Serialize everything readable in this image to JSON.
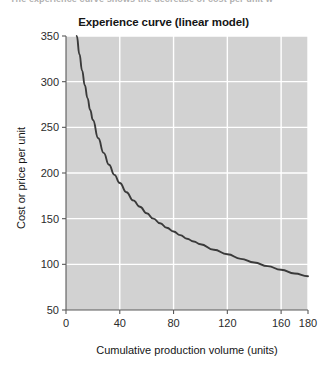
{
  "caption": {
    "text": "The experience curve shows the decrease of cost per unit w"
  },
  "figure": {
    "title": "Experience curve (linear model)",
    "xlabel": "Cumulative production volume (units)",
    "ylabel": "Cost or price per unit"
  },
  "colors": {
    "plot_background": "#d2d2d2",
    "gridline": "#ffffff",
    "curve": "#3a3a3a",
    "axis": "#5a5a5a",
    "title_text": "#151515",
    "tick_text": "#2b2b2b",
    "page_background": "#ffffff"
  },
  "chart_data": {
    "type": "line",
    "title": "Experience curve (linear model)",
    "xlabel": "Cumulative production volume (units)",
    "ylabel": "Cost or price per unit",
    "xlim": [
      0,
      180
    ],
    "ylim": [
      50,
      350
    ],
    "xticks": [
      0,
      40,
      80,
      120,
      160,
      180
    ],
    "yticks": [
      50,
      100,
      150,
      200,
      250,
      300,
      350
    ],
    "xtick_labels": [
      "0",
      "40",
      "80",
      "120",
      "160",
      "180"
    ],
    "ytick_labels": [
      "50",
      "100",
      "150",
      "200",
      "250",
      "300",
      "350"
    ],
    "grid": true,
    "legend": "none",
    "series": [
      {
        "name": "Experience curve",
        "x": [
          8,
          10,
          12,
          14,
          16,
          18,
          20,
          24,
          28,
          32,
          36,
          40,
          45,
          50,
          55,
          60,
          65,
          70,
          75,
          80,
          85,
          90,
          95,
          100,
          110,
          120,
          130,
          140,
          150,
          160,
          170,
          180
        ],
        "y": [
          350,
          330,
          312,
          296,
          282,
          269,
          258,
          238,
          222,
          209,
          198,
          189,
          179,
          170,
          163,
          156,
          150,
          145,
          140,
          136,
          132,
          128,
          125,
          122,
          116,
          111,
          106,
          102,
          98,
          94,
          90,
          87
        ]
      }
    ]
  }
}
